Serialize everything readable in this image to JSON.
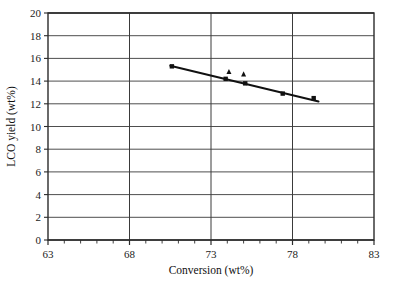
{
  "chart_data": {
    "type": "scatter",
    "title": "",
    "xlabel": "Conversion (wt%)",
    "ylabel": "LCO yield (wt%)",
    "xlim": [
      63,
      83
    ],
    "ylim": [
      0,
      20
    ],
    "xticks": [
      63,
      68,
      73,
      78,
      83
    ],
    "yticks": [
      0,
      2,
      4,
      6,
      8,
      10,
      12,
      14,
      16,
      18,
      20
    ],
    "xtick_labels": [
      "63",
      "68",
      "73",
      "78",
      "83"
    ],
    "ytick_labels": [
      "0",
      "2",
      "4",
      "6",
      "8",
      "10",
      "12",
      "14",
      "16",
      "18",
      "20"
    ],
    "x_minor_tick_step": 1,
    "grid": "horizontal-and-vertical-major",
    "legend": "none",
    "series": [
      {
        "name": "LCO yield (square markers)",
        "marker": "square",
        "points": [
          {
            "x": 70.6,
            "y": 15.3
          },
          {
            "x": 73.9,
            "y": 14.2
          },
          {
            "x": 75.1,
            "y": 13.8
          },
          {
            "x": 77.4,
            "y": 12.9
          },
          {
            "x": 79.3,
            "y": 12.5
          }
        ]
      },
      {
        "name": "LCO yield (triangle markers)",
        "marker": "triangle",
        "points": [
          {
            "x": 74.1,
            "y": 14.8
          },
          {
            "x": 75.0,
            "y": 14.6
          }
        ]
      }
    ],
    "trendline": {
      "name": "linear fit",
      "x_start": 70.5,
      "y_start": 15.35,
      "x_end": 79.6,
      "y_end": 12.2
    }
  }
}
